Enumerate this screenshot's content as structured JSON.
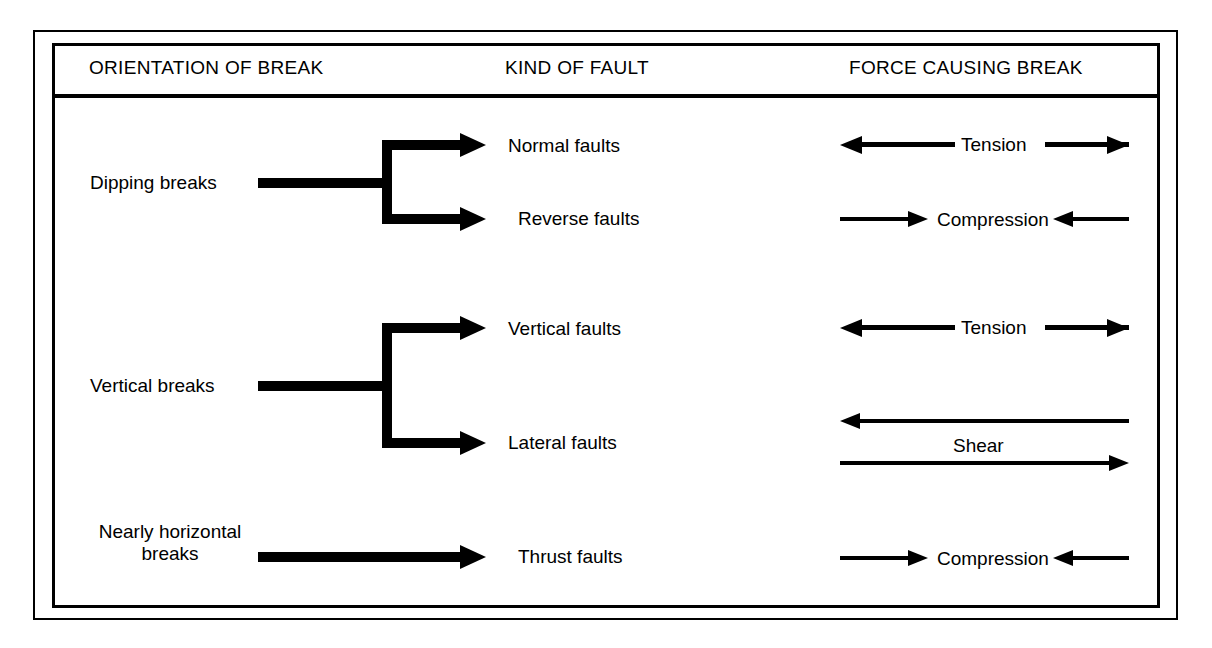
{
  "diagram": {
    "frame": {
      "style": "double-rule-box",
      "color": "#000000"
    },
    "background": "#ffffff",
    "ink": "#000000"
  },
  "headers": [
    {
      "label": "ORIENTATION OF BREAK"
    },
    {
      "label": "KIND OF FAULT"
    },
    {
      "label": "FORCE CAUSING BREAK"
    }
  ],
  "rows": [
    {
      "orientation": "Dipping breaks",
      "branch": "split-two",
      "faults": [
        {
          "label": "Normal faults",
          "force": "Tension",
          "force_direction": "outward"
        },
        {
          "label": "Reverse faults",
          "force": "Compression",
          "force_direction": "inward"
        }
      ]
    },
    {
      "orientation": "Vertical breaks",
      "branch": "split-two",
      "faults": [
        {
          "label": "Vertical faults",
          "force": "Tension",
          "force_direction": "outward"
        },
        {
          "label": "Lateral faults",
          "force": "Shear",
          "force_direction": "opposed-pair"
        }
      ]
    },
    {
      "orientation_line1": "Nearly horizontal",
      "orientation_line2": "breaks",
      "branch": "single",
      "faults": [
        {
          "label": "Thrust faults",
          "force": "Compression",
          "force_direction": "inward"
        }
      ]
    }
  ]
}
